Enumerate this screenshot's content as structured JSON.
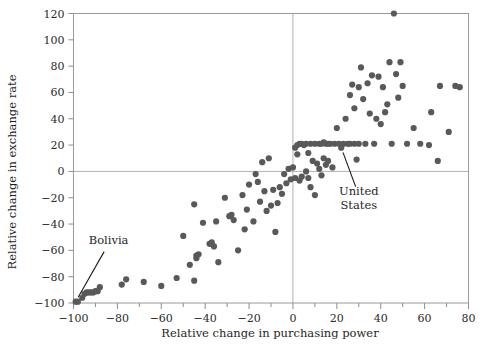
{
  "chart_data": {
    "type": "scatter",
    "title": "",
    "xlabel": "Relative change in purchasing power",
    "ylabel": "Relative change in exchange rate",
    "xlim": [
      -100,
      80
    ],
    "ylim": [
      -100,
      120
    ],
    "xticks": [
      -100,
      -80,
      -60,
      -40,
      -20,
      0,
      20,
      40,
      60,
      80
    ],
    "xtick_labels": [
      "−100",
      "−80",
      "−60",
      "−40",
      "−20",
      "0",
      "20",
      "40",
      "60",
      "80"
    ],
    "xminor_step": 10,
    "yticks": [
      -100,
      -80,
      -60,
      -40,
      -20,
      0,
      20,
      40,
      60,
      80,
      100,
      120
    ],
    "ytick_labels": [
      "−100",
      "−80",
      "−60",
      "−40",
      "−20",
      "0",
      "20",
      "40",
      "60",
      "80",
      "100",
      "120"
    ],
    "grid": false,
    "reference_lines": [
      {
        "axis": "x",
        "value": 0
      },
      {
        "axis": "y",
        "value": 0
      }
    ],
    "legend": null,
    "marker_color": "#59595b",
    "marker_size": 3.1,
    "annotations": [
      {
        "label": "Bolivia",
        "text_x": -84,
        "text_y": -55,
        "point_x": -99,
        "point_y": -99
      },
      {
        "label": "United\nStates",
        "line1": "United",
        "line2": "States",
        "text_x": 30,
        "text_y": -18,
        "point_x": 22,
        "point_y": 18
      }
    ],
    "points": [
      [
        -99,
        -99
      ],
      [
        -98,
        -99
      ],
      [
        -96,
        -96
      ],
      [
        -95,
        -93
      ],
      [
        -94,
        -92
      ],
      [
        -93,
        -92
      ],
      [
        -92,
        -92
      ],
      [
        -91,
        -92
      ],
      [
        -90,
        -91
      ],
      [
        -89,
        -91
      ],
      [
        -88,
        -88
      ],
      [
        -78,
        -86
      ],
      [
        -76,
        -82
      ],
      [
        -68,
        -84
      ],
      [
        -60,
        -87
      ],
      [
        -53,
        -81
      ],
      [
        -50,
        -49
      ],
      [
        -47,
        -71
      ],
      [
        -45,
        -25
      ],
      [
        -45,
        -83
      ],
      [
        -44,
        -64
      ],
      [
        -44,
        -66
      ],
      [
        -43,
        -63
      ],
      [
        -41,
        -39
      ],
      [
        -38,
        -55
      ],
      [
        -37,
        -54
      ],
      [
        -36,
        -57
      ],
      [
        -35,
        -38
      ],
      [
        -34,
        -69
      ],
      [
        -31,
        -20
      ],
      [
        -29,
        -34
      ],
      [
        -28,
        -33
      ],
      [
        -27,
        -37
      ],
      [
        -25,
        -60
      ],
      [
        -23,
        -18
      ],
      [
        -22,
        -44
      ],
      [
        -21,
        -29
      ],
      [
        -20,
        -10
      ],
      [
        -18,
        -38
      ],
      [
        -17,
        -2
      ],
      [
        -16,
        -8
      ],
      [
        -15,
        -23
      ],
      [
        -14,
        7
      ],
      [
        -13,
        -15
      ],
      [
        -12,
        -30
      ],
      [
        -11,
        10
      ],
      [
        -10,
        -26
      ],
      [
        -9,
        -14
      ],
      [
        -8,
        -46
      ],
      [
        -7,
        -24
      ],
      [
        -6,
        -12
      ],
      [
        -5,
        -17
      ],
      [
        -4,
        -2
      ],
      [
        -3,
        -9
      ],
      [
        -2,
        2
      ],
      [
        -1,
        -6
      ],
      [
        0,
        3
      ],
      [
        1,
        -5
      ],
      [
        1,
        18
      ],
      [
        2,
        13
      ],
      [
        2,
        20
      ],
      [
        3,
        21
      ],
      [
        3,
        -7
      ],
      [
        4,
        21
      ],
      [
        4,
        -4
      ],
      [
        5,
        20
      ],
      [
        6,
        21
      ],
      [
        6,
        0
      ],
      [
        7,
        -5
      ],
      [
        7,
        14
      ],
      [
        8,
        21
      ],
      [
        8,
        -12
      ],
      [
        9,
        8
      ],
      [
        10,
        21
      ],
      [
        10,
        -18
      ],
      [
        11,
        6
      ],
      [
        12,
        21
      ],
      [
        12,
        2
      ],
      [
        13,
        21
      ],
      [
        13,
        -3
      ],
      [
        14,
        22
      ],
      [
        14,
        10
      ],
      [
        15,
        21
      ],
      [
        15,
        5
      ],
      [
        16,
        21
      ],
      [
        16,
        8
      ],
      [
        17,
        21
      ],
      [
        18,
        3
      ],
      [
        19,
        21
      ],
      [
        20,
        33
      ],
      [
        21,
        21
      ],
      [
        22,
        18
      ],
      [
        23,
        21
      ],
      [
        24,
        40
      ],
      [
        25,
        21
      ],
      [
        26,
        58
      ],
      [
        26,
        21
      ],
      [
        27,
        66
      ],
      [
        28,
        48
      ],
      [
        28,
        21
      ],
      [
        29,
        9
      ],
      [
        30,
        64
      ],
      [
        30,
        21
      ],
      [
        31,
        79
      ],
      [
        32,
        55
      ],
      [
        33,
        21
      ],
      [
        34,
        67
      ],
      [
        35,
        44
      ],
      [
        36,
        73
      ],
      [
        37,
        21
      ],
      [
        38,
        40
      ],
      [
        39,
        72
      ],
      [
        40,
        36
      ],
      [
        41,
        64
      ],
      [
        42,
        45
      ],
      [
        43,
        51
      ],
      [
        44,
        83
      ],
      [
        45,
        21
      ],
      [
        46,
        120
      ],
      [
        47,
        74
      ],
      [
        48,
        56
      ],
      [
        49,
        83
      ],
      [
        50,
        65
      ],
      [
        52,
        21
      ],
      [
        55,
        33
      ],
      [
        58,
        21
      ],
      [
        62,
        20
      ],
      [
        63,
        45
      ],
      [
        66,
        8
      ],
      [
        67,
        65
      ],
      [
        71,
        30
      ],
      [
        74,
        65
      ],
      [
        76,
        64
      ]
    ]
  }
}
